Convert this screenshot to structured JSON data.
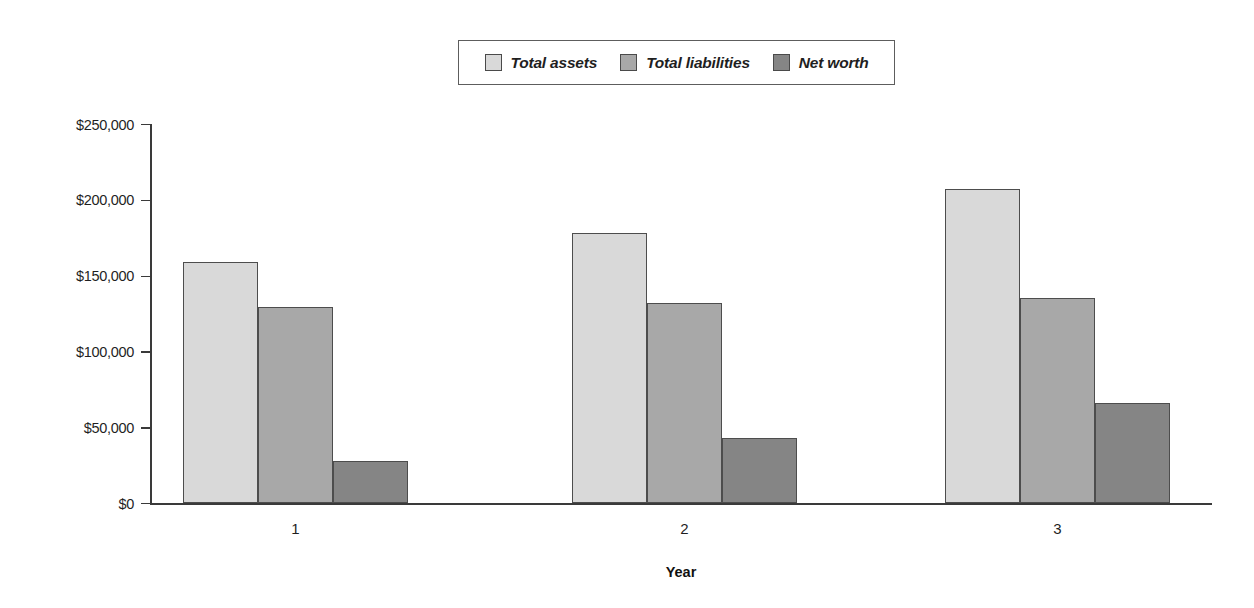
{
  "chart_data": {
    "type": "bar",
    "title": "",
    "subtitle": "",
    "xlabel": "Year",
    "ylabel": "",
    "categories": [
      "1",
      "2",
      "3"
    ],
    "series": [
      {
        "name": "Total assets",
        "color": "#d9d9d9",
        "values": [
          159000,
          178000,
          207000
        ]
      },
      {
        "name": "Total liabilities",
        "color": "#a8a8a8",
        "values": [
          129000,
          132000,
          135000
        ]
      },
      {
        "name": "Net worth",
        "color": "#858585",
        "values": [
          28000,
          43000,
          66000
        ]
      }
    ],
    "ylim": [
      0,
      250000
    ],
    "ytick_values": [
      0,
      50000,
      100000,
      150000,
      200000,
      250000
    ],
    "ytick_labels": [
      "$0",
      "$50,000",
      "$100,000",
      "$150,000",
      "$200,000",
      "$250,000"
    ],
    "grid": false,
    "legend_position": "top-center",
    "legend_entries": [
      "Total assets",
      "Total liabilities",
      "Net worth"
    ]
  },
  "axis": {
    "x_title": "Year"
  },
  "colors": {
    "total_assets": "#d9d9d9",
    "total_liabilities": "#a8a8a8",
    "net_worth": "#858585",
    "bar_outline": "#4d4d4d",
    "axis": "#3a3a3a"
  }
}
